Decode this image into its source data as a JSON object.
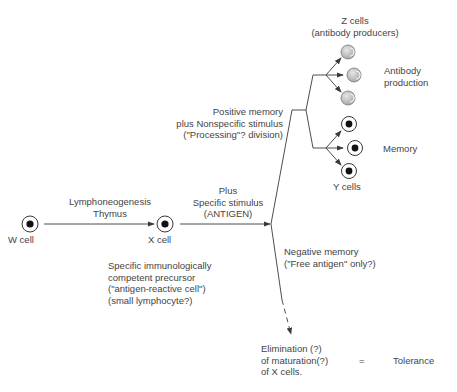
{
  "diagram": {
    "cells": {
      "w": {
        "label": "W cell"
      },
      "x": {
        "label": "X cell"
      },
      "y": {
        "label": "Y cells"
      },
      "z": {
        "label_line1": "Z cells",
        "label_line2": "(antibody producers)"
      }
    },
    "edges": {
      "w_to_x": {
        "line1": "Lymphoneogenesis",
        "line2": "Thymus"
      },
      "x_to_branch": {
        "line1": "Plus",
        "line2": "Specific stimulus",
        "line3": "(ANTIGEN)"
      },
      "positive": {
        "line1": "Positive memory",
        "line2": "plus Nonspecific stimulus",
        "line3": "(\"Processing\"? division)"
      },
      "negative": {
        "line1": "Negative memory",
        "line2": "(\"Free antigen\" only?)"
      }
    },
    "x_description": {
      "line1": "Specific immunologically",
      "line2": "competent precursor",
      "line3": "(\"antigen-reactive cell\")",
      "line4": "(small lymphocyte?)"
    },
    "outcomes": {
      "antibody": {
        "line1": "Antibody",
        "line2": "production"
      },
      "memory": "Memory",
      "elimination": {
        "line1": "Elimination (?)",
        "line2": "of maturation(?)",
        "line3": "of X cells."
      },
      "equals": "=",
      "tolerance": "Tolerance"
    },
    "colors": {
      "line": "#3a3a3a",
      "z_cell_fill": "#c8c8c8",
      "nucleus": "#111111"
    }
  }
}
